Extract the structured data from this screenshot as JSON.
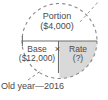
{
  "diagram": {
    "name": "percentage-formula-circle",
    "background_color": "#ffffff",
    "stroke_color": "#7a7a7a",
    "text_color": "#4a4a4a",
    "shade_color": "#d9d9d9",
    "sections": {
      "portion": {
        "title": "Portion",
        "value": "($4,000)"
      },
      "base": {
        "title": "Base",
        "value": "($12,000)"
      },
      "rate": {
        "title": "Rate",
        "value": "(?)"
      }
    },
    "operator": "×",
    "caption": "Old year—2016"
  }
}
